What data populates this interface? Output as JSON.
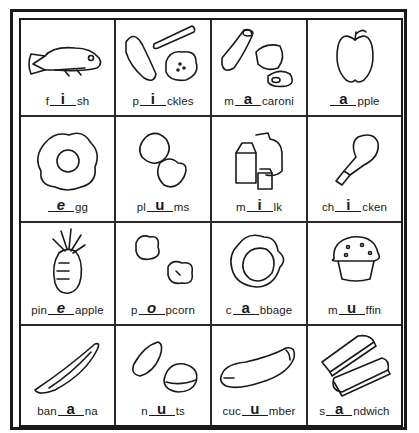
{
  "worksheet": {
    "cells": [
      {
        "id": "fish",
        "prefix": "f",
        "answer": "i",
        "suffix": "sh",
        "icon": "fish-icon"
      },
      {
        "id": "pickles",
        "prefix": "p",
        "answer": "i",
        "suffix": "ckles",
        "icon": "pickles-icon"
      },
      {
        "id": "macaroni",
        "prefix": "m",
        "answer": "a",
        "suffix": "caroni",
        "icon": "macaroni-icon"
      },
      {
        "id": "apple",
        "prefix": "",
        "answer": "a",
        "suffix": "pple",
        "icon": "apple-icon"
      },
      {
        "id": "egg",
        "prefix": "",
        "answer": "e",
        "suffix": "gg",
        "icon": "egg-icon"
      },
      {
        "id": "plums",
        "prefix": "pl",
        "answer": "u",
        "suffix": "ms",
        "icon": "plums-icon"
      },
      {
        "id": "milk",
        "prefix": "m",
        "answer": "i",
        "suffix": "lk",
        "icon": "milk-icon"
      },
      {
        "id": "chicken",
        "prefix": "ch",
        "answer": "i",
        "suffix": "cken",
        "icon": "chicken-leg-icon"
      },
      {
        "id": "pineapple",
        "prefix": "pin",
        "answer": "e",
        "suffix": "apple",
        "icon": "pineapple-icon"
      },
      {
        "id": "popcorn",
        "prefix": "p",
        "answer": "o",
        "suffix": "pcorn",
        "icon": "popcorn-icon"
      },
      {
        "id": "cabbage",
        "prefix": "c",
        "answer": "a",
        "suffix": "bbage",
        "icon": "cabbage-icon"
      },
      {
        "id": "muffin",
        "prefix": "m",
        "answer": "u",
        "suffix": "ffin",
        "icon": "muffin-icon"
      },
      {
        "id": "banana",
        "prefix": "ban",
        "answer": "a",
        "suffix": "na",
        "icon": "banana-icon"
      },
      {
        "id": "nuts",
        "prefix": "n",
        "answer": "u",
        "suffix": "ts",
        "icon": "nuts-icon"
      },
      {
        "id": "cucumber",
        "prefix": "cuc",
        "answer": "u",
        "suffix": "mber",
        "icon": "cucumber-icon"
      },
      {
        "id": "sandwich",
        "prefix": "s",
        "answer": "a",
        "suffix": "ndwich",
        "icon": "sandwich-icon"
      }
    ]
  }
}
